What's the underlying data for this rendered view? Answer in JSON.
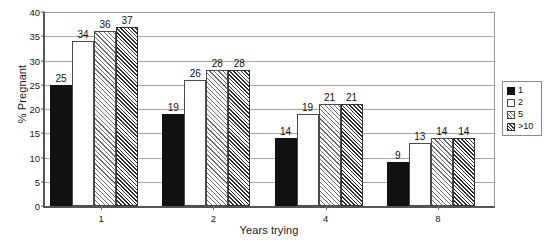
{
  "chart_data": {
    "type": "bar",
    "title": "",
    "xlabel": "Years trying",
    "ylabel": "% Pregnant",
    "categories": [
      "1",
      "2",
      "4",
      "8"
    ],
    "series": [
      {
        "name": "1",
        "values": [
          25,
          19,
          14,
          9
        ],
        "fill": "solid-black"
      },
      {
        "name": "2",
        "values": [
          34,
          26,
          19,
          13
        ],
        "fill": "white"
      },
      {
        "name": "5",
        "values": [
          36,
          28,
          21,
          14
        ],
        "fill": "light-diagonal-hatch"
      },
      {
        "name": ">10",
        "values": [
          37,
          28,
          21,
          14
        ],
        "fill": "dense-diagonal-hatch"
      }
    ],
    "ylim": [
      0,
      40
    ],
    "yticks": [
      0,
      5,
      10,
      15,
      20,
      25,
      30,
      35,
      40
    ],
    "grid": "horizontal",
    "legend_position": "right",
    "data_labels": true
  },
  "legend": {
    "entries": [
      {
        "label": "1"
      },
      {
        "label": "2"
      },
      {
        "label": "5"
      },
      {
        "label": ">10"
      }
    ]
  },
  "colors": {
    "series1": "#111111",
    "series2": "#ffffff",
    "series3": "#6f6f6f",
    "series4": "#2e2e2e",
    "axis": "#555555",
    "grid": "#a8a8a8",
    "background": "#ffffff"
  }
}
